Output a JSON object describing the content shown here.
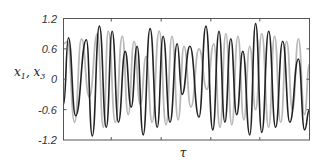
{
  "chart_data": {
    "type": "line",
    "title": "",
    "xlabel": "τ",
    "ylabel": "x1, x3",
    "ylim": [
      -1.2,
      1.2
    ],
    "yticks": [
      1.2,
      0.6,
      0,
      -0.6,
      -1.2
    ],
    "ytick_labels": [
      "1.2",
      "0.6",
      "0",
      "-0.6",
      "-1.2"
    ],
    "xlim": [
      0,
      100
    ],
    "xticks": [
      19.4,
      39.7,
      59.9,
      79.8
    ],
    "xtick_labels": [],
    "grid": false,
    "legend": null,
    "series": [
      {
        "name": "x3",
        "color": "#b8b8b8",
        "x": [
          0,
          1.6,
          4.5,
          7.3,
          10.5,
          13.8,
          16.2,
          18.2,
          21.1,
          23.9,
          26.3,
          28.7,
          31.2,
          33.6,
          36.0,
          38.9,
          41.7,
          44.1,
          46.6,
          49.0,
          51.8,
          55.1,
          58.3,
          61.1,
          63.6,
          66.0,
          68.4,
          70.9,
          73.3,
          75.7,
          78.1,
          80.6,
          83.4,
          85.8,
          88.3,
          90.7,
          93.1,
          95.5,
          98.0,
          100
        ],
        "y": [
          0.7,
          0.75,
          -0.85,
          0.8,
          -0.35,
          0.9,
          -0.95,
          0.95,
          -0.85,
          0.85,
          -0.7,
          0.75,
          -0.5,
          0.45,
          -0.85,
          0.95,
          -0.9,
          0.85,
          -0.8,
          0.65,
          -0.55,
          0.6,
          -0.2,
          0.7,
          -0.95,
          0.9,
          -0.9,
          0.85,
          -0.8,
          0.65,
          -0.6,
          0.9,
          -0.95,
          0.85,
          -0.85,
          0.75,
          -0.6,
          0.8,
          -0.7,
          0.3
        ]
      },
      {
        "name": "x1",
        "color": "#222222",
        "x": [
          0,
          2.0,
          4.9,
          9.3,
          11.7,
          14.6,
          17.4,
          19.8,
          22.3,
          25.1,
          27.5,
          29.9,
          32.4,
          35.2,
          38.1,
          40.5,
          43.3,
          46.2,
          48.2,
          51.4,
          55.1,
          57.9,
          60.7,
          63.2,
          65.6,
          68.0,
          70.4,
          72.9,
          75.7,
          78.1,
          80.6,
          83.4,
          86.2,
          89.1,
          92.0,
          95.5,
          98.0,
          100
        ],
        "y": [
          -0.5,
          0.82,
          -0.72,
          0.78,
          -1.12,
          1.05,
          -0.95,
          0.95,
          -0.85,
          0.55,
          -0.55,
          0.65,
          -1.1,
          1.0,
          -0.95,
          0.85,
          -0.85,
          0.7,
          -0.3,
          0.65,
          -0.75,
          1.05,
          -1.0,
          0.95,
          -0.85,
          0.8,
          -0.7,
          0.55,
          -1.1,
          1.1,
          -1.05,
          0.95,
          -0.95,
          0.75,
          -0.85,
          0.4,
          -1.0,
          -0.6
        ]
      }
    ]
  },
  "axes": {
    "ylabel_text": "x",
    "ylabel_sub1": "1",
    "ylabel_sep": ", x",
    "ylabel_sub2": "3",
    "xlabel_text": "τ"
  }
}
